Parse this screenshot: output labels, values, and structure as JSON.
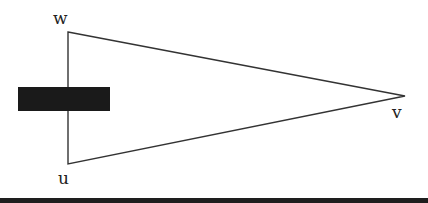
{
  "diagram": {
    "type": "triangle",
    "vertices": [
      {
        "name": "w",
        "x": 68,
        "y": 32
      },
      {
        "name": "v",
        "x": 405,
        "y": 96
      },
      {
        "name": "u",
        "x": 68,
        "y": 164
      }
    ],
    "labels": {
      "w": "w",
      "v": "v",
      "u": "u"
    },
    "redaction_box": {
      "x": 18,
      "y": 87,
      "width": 92,
      "height": 24,
      "color": "#1a1a1a"
    },
    "stroke_color": "#333333"
  }
}
